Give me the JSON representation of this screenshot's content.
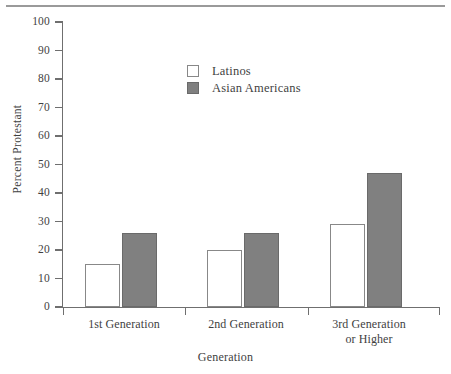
{
  "chart_data": {
    "type": "bar",
    "title": "",
    "subtitle": "",
    "xlabel": "Generation",
    "ylabel": "Percent Protestant",
    "categories": [
      "1st Generation",
      "2nd Generation",
      "3rd Generation or Higher"
    ],
    "category_lines": [
      [
        "1st Generation"
      ],
      [
        "2nd Generation"
      ],
      [
        "3rd Generation",
        "or Higher"
      ]
    ],
    "series": [
      {
        "name": "Latinos",
        "values": [
          15,
          20,
          29
        ],
        "color": "#ffffff",
        "edge_color": "#888888"
      },
      {
        "name": "Asian Americans",
        "values": [
          26,
          26,
          47
        ],
        "color": "#808080",
        "edge_color": "#6a6a6a"
      }
    ],
    "ylim": [
      0,
      100
    ],
    "ytick_values": [
      0,
      10,
      20,
      30,
      40,
      50,
      60,
      70,
      80,
      90,
      100
    ],
    "ytick_labels": [
      "0",
      "10",
      "20",
      "30",
      "40",
      "50",
      "60",
      "70",
      "80",
      "90",
      "100"
    ],
    "grid": false,
    "legend_position": "upper-center",
    "axis_color": "#6f6f6f",
    "text_color": "#3f3f3f"
  },
  "legend": {
    "entries": [
      {
        "label": "Latinos"
      },
      {
        "label": "Asian Americans"
      }
    ]
  },
  "axes": {
    "y_title": "Percent Protestant",
    "x_title": "Generation"
  }
}
